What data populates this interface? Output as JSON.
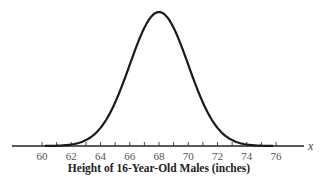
{
  "chart_data": {
    "type": "line",
    "title": "",
    "xlabel": "Height of 16-Year-Old Males (inches)",
    "ylabel": "",
    "axis_variable": "x",
    "distribution": "normal",
    "mean": 68,
    "std_dev": 2,
    "xlim": [
      58,
      78
    ],
    "x_tick_labels": [
      "60",
      "62",
      "64",
      "66",
      "68",
      "70",
      "72",
      "74",
      "76"
    ],
    "x_minor_tick_step": 1,
    "x_tick_range": [
      60,
      76
    ],
    "grid": false,
    "legend": null,
    "colors": {
      "curve": "#1a1a1a",
      "axis": "#222222",
      "text": "#555555"
    }
  }
}
